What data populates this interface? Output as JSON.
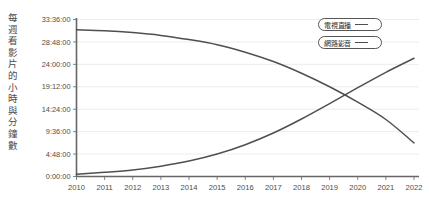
{
  "chart_data": {
    "type": "line",
    "title": "",
    "xlabel": "",
    "ylabel": "每週看影片的小時與分鐘數",
    "x": [
      2010,
      2011,
      2012,
      2013,
      2014,
      2015,
      2016,
      2017,
      2018,
      2019,
      2020,
      2021,
      2022
    ],
    "xtick_labels": [
      "2010",
      "2011",
      "2012",
      "2013",
      "2014",
      "2015",
      "2016",
      "2017",
      "2018",
      "2019",
      "2020",
      "2021",
      "2022"
    ],
    "ytick_labels": [
      "33:36:00",
      "28:48:00",
      "24:00:00",
      "19:12:00",
      "14:24:00",
      "9:36:00",
      "4:48:00",
      "0:00:00"
    ],
    "ytick_values": [
      33.6,
      28.8,
      24.0,
      19.2,
      14.4,
      9.6,
      4.8,
      0.0
    ],
    "ylim": [
      0.0,
      33.6
    ],
    "xlim": [
      2010,
      2022
    ],
    "grid": true,
    "legend_position": "top-right",
    "series": [
      {
        "name": "電視直播",
        "color": "#4f4f4f",
        "values": [
          31.4,
          31.2,
          30.8,
          30.2,
          29.3,
          28.2,
          26.6,
          24.6,
          22.1,
          19.2,
          15.9,
          12.2,
          7.2
        ]
      },
      {
        "name": "網路影音",
        "color": "#4f4f4f",
        "values": [
          0.5,
          0.9,
          1.4,
          2.2,
          3.3,
          4.8,
          6.8,
          9.3,
          12.3,
          15.6,
          19.0,
          22.3,
          25.3
        ]
      }
    ]
  },
  "legend": {
    "items": [
      {
        "label": "電視直播"
      },
      {
        "label": "網路影音"
      }
    ]
  },
  "axes": {
    "y_title": "每週看影片的小時與分鐘數"
  }
}
